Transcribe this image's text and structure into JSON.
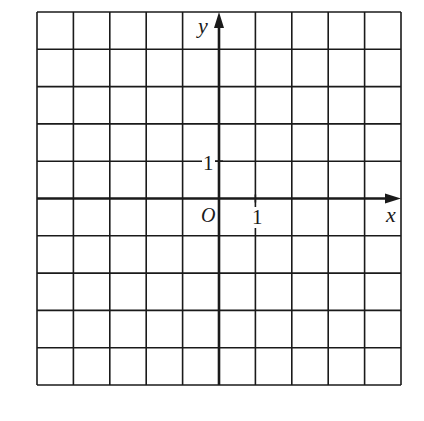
{
  "diagram": {
    "type": "coordinate-grid",
    "grid": {
      "columns": 10,
      "rows": 10,
      "left": 37,
      "top": 12,
      "right": 401,
      "bottom": 385
    },
    "origin": {
      "col": 5,
      "row": 5
    },
    "colors": {
      "line": "#1a1a1a",
      "background": "#ffffff"
    },
    "labels": {
      "x_axis": "x",
      "y_axis": "y",
      "origin": "O",
      "x_tick": "1",
      "y_tick": "1"
    }
  }
}
